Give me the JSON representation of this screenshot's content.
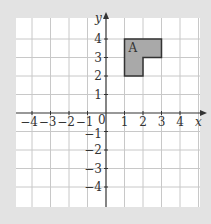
{
  "diagram": {
    "type": "coordinate-grid",
    "x_axis": {
      "label": "x",
      "ticks": [
        "-4",
        "-3",
        "-2",
        "-1",
        "1",
        "2",
        "3",
        "4"
      ],
      "origin_label": "0",
      "range": [
        -5,
        5
      ]
    },
    "y_axis": {
      "label": "y",
      "ticks": [
        "4",
        "3",
        "2",
        "1",
        "-1",
        "-2",
        "-3",
        "-4"
      ],
      "range": [
        -5,
        5
      ]
    },
    "shape": {
      "label": "A",
      "vertices": [
        [
          1,
          2
        ],
        [
          1,
          4
        ],
        [
          3,
          4
        ],
        [
          3,
          3
        ],
        [
          2,
          3
        ],
        [
          2,
          2
        ]
      ],
      "fill": "#a9a9a9",
      "stroke": "#333333"
    },
    "colors": {
      "background": "#e3e3e3",
      "grid_bg": "#ffffff",
      "grid_line": "#c8c8c8",
      "axis": "#333333"
    }
  }
}
